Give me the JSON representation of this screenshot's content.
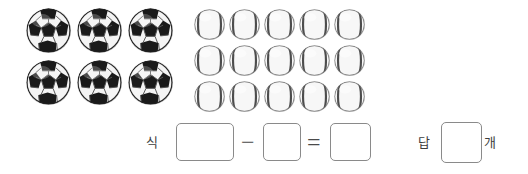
{
  "worksheet": {
    "background_color": "#ffffff",
    "soccer_group": {
      "icon": "soccer-ball-icon",
      "count": 6,
      "rows": 2,
      "columns": 3,
      "colors": {
        "panel_dark": "#1a1a1a",
        "panel_light": "#f5f5f5",
        "outline": "#2b2b2b"
      }
    },
    "baseball_group": {
      "icon": "baseball-icon",
      "count": 15,
      "rows": 3,
      "columns": 5,
      "colors": {
        "body": "#f2f2f2",
        "seam": "#4d4d4d",
        "shade": "#bdbdbd"
      }
    },
    "answer_row": {
      "expression_label": "식",
      "minus_operator": "−",
      "equals_operator": "=",
      "answer_label": "답",
      "unit_label": "개",
      "box_minuend_value": "",
      "box_subtrahend_value": "",
      "box_result_value": "",
      "box_answer_value": "",
      "box_border_color": "#8a8a8a",
      "text_color": "#3d3d3d"
    }
  }
}
